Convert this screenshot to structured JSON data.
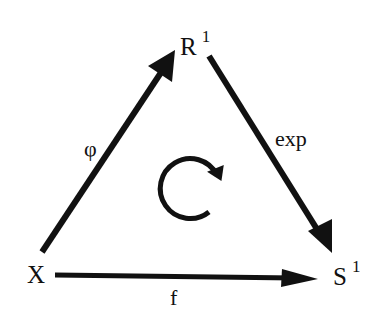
{
  "diagram": {
    "type": "commutative-diagram",
    "nodes": {
      "X": {
        "base": "X",
        "sup": ""
      },
      "R1": {
        "base": "R",
        "sup": "1"
      },
      "S1": {
        "base": "S",
        "sup": "1"
      }
    },
    "edges": {
      "phi": {
        "from": "X",
        "to": "R1",
        "label": "φ"
      },
      "exp": {
        "from": "R1",
        "to": "S1",
        "label": "exp"
      },
      "f": {
        "from": "X",
        "to": "S1",
        "label": "f"
      }
    },
    "center_symbol": "clockwise-circular-arrow",
    "colors": {
      "ink": "#111111",
      "background": "#ffffff"
    }
  }
}
